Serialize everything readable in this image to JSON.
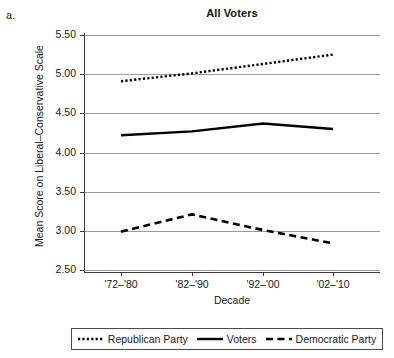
{
  "panel": {
    "letter": "a."
  },
  "chart_data": {
    "type": "line",
    "title": "All Voters",
    "xlabel": "Decade",
    "ylabel": "Mean Score on Liberal–Conservative Scale",
    "categories": [
      "'72–'80",
      "'82–'90",
      "'92–'00",
      "'02–'10"
    ],
    "ylim": [
      2.5,
      5.5
    ],
    "yticks": [
      "2.50",
      "3.00",
      "3.50",
      "4.00",
      "4.50",
      "5.00",
      "5.50"
    ],
    "ytick_values": [
      2.5,
      3.0,
      3.5,
      4.0,
      4.5,
      5.0,
      5.5
    ],
    "grid": true,
    "legend_position": "bottom",
    "series": [
      {
        "name": "Republican Party",
        "style": "dotted",
        "color": "#000000",
        "values": [
          4.91,
          5.01,
          5.13,
          5.25
        ]
      },
      {
        "name": "Voters",
        "style": "solid",
        "color": "#000000",
        "values": [
          4.22,
          4.27,
          4.37,
          4.3
        ]
      },
      {
        "name": "Democratic Party",
        "style": "dashed",
        "color": "#000000",
        "values": [
          2.99,
          3.21,
          3.01,
          2.84
        ]
      }
    ]
  },
  "legend": {
    "items": [
      {
        "label": "Republican Party",
        "style": "dotted"
      },
      {
        "label": "Voters",
        "style": "solid"
      },
      {
        "label": "Democratic Party",
        "style": "dashed"
      }
    ]
  }
}
